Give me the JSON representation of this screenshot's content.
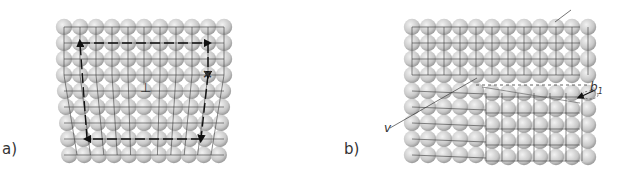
{
  "figure": {
    "panels": [
      {
        "id": "a",
        "label": "a)",
        "description": "Edge dislocation with Burgers circuit",
        "lattice": {
          "cols": 11,
          "rows": 9
        },
        "markers": {
          "dislocation_symbol": "⊥",
          "start_mark": "×"
        }
      },
      {
        "id": "b",
        "label": "b)",
        "description": "Screw dislocation",
        "lattice": {
          "cols": 12,
          "rows": 9
        },
        "annotations": {
          "line_label": "v",
          "burgers_vector_label": "b",
          "burgers_vector_subscript": "1"
        }
      }
    ],
    "colors": {
      "atom_fill": "#c8c8c8",
      "atom_highlight": "#f2f2f2",
      "grid_line": "#3a3a3a",
      "circuit_line": "#111111",
      "background": "#ffffff"
    }
  }
}
